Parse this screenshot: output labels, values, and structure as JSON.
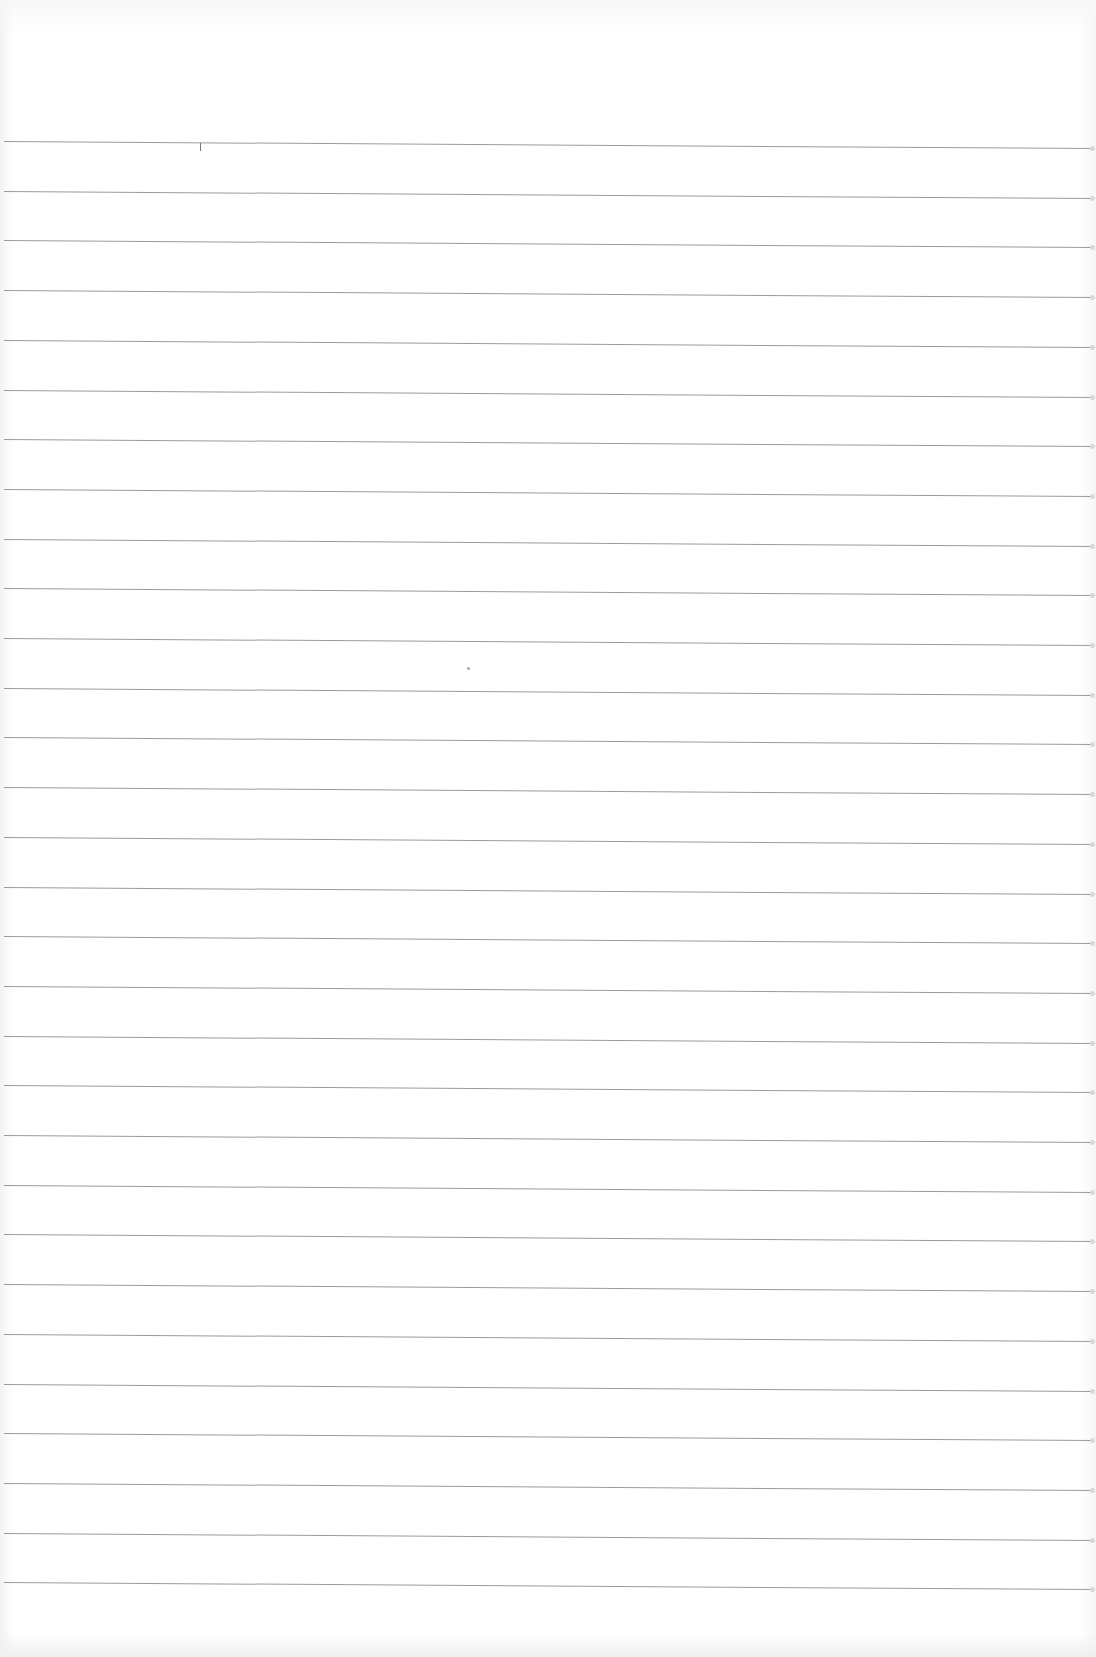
{
  "document": {
    "type": "blank lined notebook paper",
    "background_color": "#ffffff",
    "line_color": "#8a8a8a",
    "line_count": 30,
    "first_line_y": 141,
    "line_spacing": 49.7,
    "text_content": ""
  },
  "marks": [
    {
      "kind": "tick",
      "x": 200,
      "y": 143,
      "height": 8
    },
    {
      "kind": "speck",
      "x": 467,
      "y": 667
    }
  ]
}
